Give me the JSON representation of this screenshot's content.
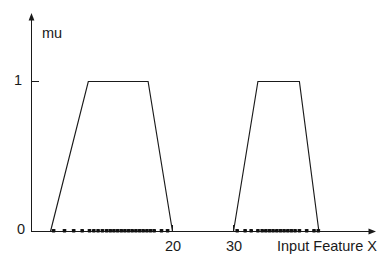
{
  "chart_data": {
    "type": "line",
    "title": "",
    "subtitle": "",
    "xlabel": "Input Feature X",
    "ylabel": "mu",
    "xlim": [
      0,
      48
    ],
    "ylim": [
      0,
      1.18
    ],
    "grid": false,
    "legend": null,
    "xticks": [
      20,
      30
    ],
    "xtick_labels": [
      "20",
      "30"
    ],
    "yticks": [
      0,
      1
    ],
    "ytick_labels": [
      "0",
      "1"
    ],
    "axis_style": "arrowed-open-spine",
    "series": [
      {
        "name": "membership-function-low",
        "type": "trapezoid",
        "x": [
          0.0,
          6.2,
          16.0,
          20.0
        ],
        "y": [
          0,
          1,
          1,
          0
        ],
        "color": "#1a1a1a"
      },
      {
        "name": "membership-function-high",
        "type": "trapezoid",
        "x": [
          30.0,
          34.0,
          40.8,
          44.0
        ],
        "y": [
          0,
          1,
          1,
          0
        ],
        "color": "#1a1a1a"
      },
      {
        "name": "data-samples",
        "type": "scatter",
        "marker": "square-dot",
        "color": "#111111",
        "y_value": 0,
        "x": [
          0.5,
          2.3,
          3.8,
          5.2,
          6.4,
          7.1,
          7.8,
          8.5,
          9.2,
          9.8,
          10.4,
          11.0,
          11.6,
          12.2,
          12.8,
          13.4,
          14.0,
          14.6,
          15.2,
          15.8,
          16.4,
          17.0,
          18.2,
          19.2,
          30.6,
          31.9,
          32.9,
          34.0,
          34.7,
          35.3,
          35.9,
          36.5,
          37.1,
          37.7,
          38.3,
          38.9,
          39.5,
          40.1,
          40.8,
          42.0,
          43.2,
          43.9
        ]
      }
    ]
  },
  "labels": {
    "y_axis_label": "mu",
    "y_tick_top": "1",
    "y_tick_bottom": "0",
    "x_tick_left": "20",
    "x_tick_right": "30",
    "x_axis_title": "Input Feature X"
  },
  "colors": {
    "line": "#1a1a1a",
    "axis": "#1a1a1a",
    "dot": "#111111",
    "background": "#ffffff"
  }
}
